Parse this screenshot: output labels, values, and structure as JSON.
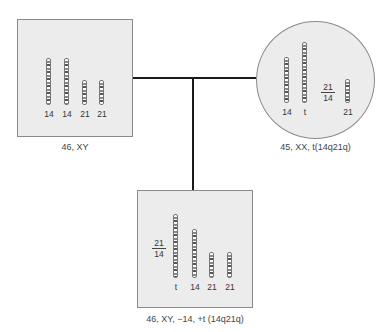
{
  "diagram": {
    "type": "pedigree-karyotype",
    "father": {
      "shape": "square",
      "caption": "46, XY",
      "chromosomes": [
        {
          "label": "14"
        },
        {
          "label": "14"
        },
        {
          "label": "21"
        },
        {
          "label": "21"
        }
      ]
    },
    "mother": {
      "shape": "circle",
      "caption": "45, XX, t(14q21q)",
      "chromosomes": [
        {
          "label": "14"
        },
        {
          "label": "t"
        },
        {
          "label": "21"
        }
      ],
      "fraction": {
        "top": "21",
        "bottom": "14"
      }
    },
    "child": {
      "shape": "square",
      "caption": "46, XY, −14, +t (14q21q)",
      "chromosomes": [
        {
          "label": "t"
        },
        {
          "label": "14"
        },
        {
          "label": "21"
        },
        {
          "label": "21"
        }
      ],
      "fraction": {
        "top": "21",
        "bottom": "14"
      }
    },
    "colors": {
      "box_fill": "#ececec",
      "border": "#8a8a8a",
      "line": "#1a1a1a"
    }
  }
}
